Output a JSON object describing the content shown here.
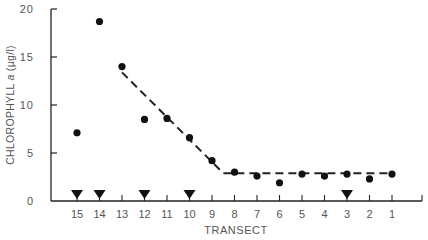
{
  "chart_data": {
    "type": "scatter",
    "title": "",
    "xlabel": "TRANSECT",
    "ylabel": "CHLOROPHYLL a (µg/l)",
    "ylim": [
      0,
      20
    ],
    "yticks": [
      0,
      5,
      10,
      15,
      20
    ],
    "categories": [
      "15",
      "14",
      "13",
      "12",
      "11",
      "10",
      "9",
      "8",
      "7",
      "6",
      "5",
      "4",
      "3",
      "2",
      "1"
    ],
    "series": [
      {
        "name": "Chlorophyll a",
        "marker": "circle",
        "values": [
          7.1,
          18.7,
          14.0,
          8.5,
          8.6,
          6.6,
          4.2,
          3.0,
          2.6,
          1.9,
          2.8,
          2.6,
          2.8,
          2.3,
          2.8
        ]
      }
    ],
    "fit_line": {
      "style": "dashed",
      "points": [
        {
          "x": "13",
          "y": 13.4
        },
        {
          "x": "8.5",
          "y": 2.9
        },
        {
          "x": "1",
          "y": 2.9
        }
      ]
    },
    "markers_on_axis": {
      "symbol": "triangle-down",
      "transects": [
        "15",
        "14",
        "12",
        "10",
        "3"
      ]
    },
    "grid": false,
    "legend": null
  },
  "labels": {
    "x_axis": "TRANSECT",
    "y_axis_main": "CHLOROPHYLL ",
    "y_axis_italic": "a",
    "y_axis_unit": " (µg/l)"
  }
}
